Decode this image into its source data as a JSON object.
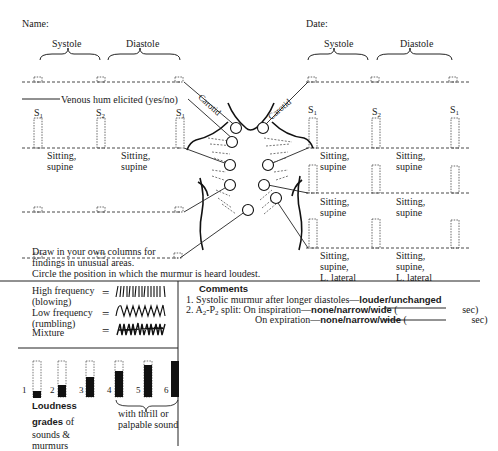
{
  "header": {
    "name_label": "Name:",
    "date_label": "Date:"
  },
  "left_panel": {
    "systole_label": "Systole",
    "diastole_label": "Diastole",
    "venous_hum_label": "Venous hum elicited (yes/no)",
    "sound_labels": [
      "S",
      "S",
      "S"
    ],
    "sound_subscripts": [
      "1",
      "2",
      "1"
    ],
    "positions_row1": [
      "Sitting,\nsupine",
      "Sitting,\nsupine"
    ],
    "draw_note_line1": "Draw in your own columns for",
    "draw_note_line2": "findings in unusual areas.",
    "circle_note": "Circle the position in which the murmur is heard loudest."
  },
  "right_panel": {
    "systole_label": "Systole",
    "diastole_label": "Diastole",
    "sound_labels": [
      "S",
      "S",
      "S"
    ],
    "sound_subscripts": [
      "1",
      "2",
      "1"
    ],
    "rows": [
      {
        "col1": [
          "Sitting,",
          "supine"
        ],
        "col2": [
          "Sitting,",
          "supine"
        ]
      },
      {
        "col1": [
          "Sitting,",
          "supine"
        ],
        "col2": [
          "Sitting,",
          "supine"
        ]
      },
      {
        "col1": [
          "Sitting,",
          "supine,",
          "L. lateral"
        ],
        "col2": [
          "Sitting,",
          "supine,",
          "L. lateral"
        ]
      }
    ]
  },
  "body_diagram": {
    "left_carotid_label": "Carotid",
    "right_carotid_label": "Carotid"
  },
  "frequency_legend": [
    {
      "label_line1": "High frequency",
      "label_line2": "(blowing)",
      "pattern": "vertical-strokes"
    },
    {
      "label_line1": "Low frequency",
      "label_line2": "(rumbling)",
      "pattern": "wave"
    },
    {
      "label_line1": "Mixture",
      "label_line2": "",
      "pattern": "mixed-scribble"
    }
  ],
  "equals_sign": "=",
  "comments": {
    "title": "Comments",
    "item1_prefix": "1.  Systolic murmur after longer diastoles—",
    "item1_options": "louder/unchanged",
    "item2_prefix": "2.  A",
    "item2_sub1": "2",
    "item2_dash": "-P",
    "item2_sub2": "2",
    "item2_split": " split: On inspiration—",
    "item2_options": "none/narrow/wide",
    "item2_paren_open": " (",
    "item2_unit": " sec)",
    "item3_prefix": "On expiration—",
    "item3_options": "none/narrow/wide",
    "item3_paren_open": " (",
    "item3_unit": " sec)"
  },
  "loudness": {
    "grades": [
      "1",
      "2",
      "3",
      "4",
      "5",
      "6"
    ],
    "filled_segments": [
      1,
      2,
      3,
      4,
      5,
      6
    ],
    "title_bold1": "Loudness",
    "title_bold2": "grades",
    "title_rest1": " of",
    "title_line3": "sounds &",
    "title_line4": "murmurs",
    "thrill_line1": "with thrill or",
    "thrill_line2": "palpable sound"
  }
}
